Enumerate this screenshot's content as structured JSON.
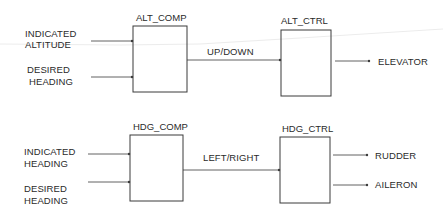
{
  "diagram": {
    "blocks": [
      {
        "id": "alt_comp",
        "title": "ALT_COMP"
      },
      {
        "id": "alt_ctrl",
        "title": "ALT_CTRL"
      },
      {
        "id": "hdg_comp",
        "title": "HDG_COMP"
      },
      {
        "id": "hdg_ctrl",
        "title": "HDG_CTRL"
      }
    ],
    "altitude_section": {
      "inputs": [
        {
          "line1": "INDICATED",
          "line2": "ALTITUDE"
        },
        {
          "line1": "DESIRED",
          "line2": "HEADING"
        }
      ],
      "link_label": "UP/DOWN",
      "outputs": [
        "ELEVATOR"
      ]
    },
    "heading_section": {
      "inputs": [
        {
          "line1": "INDICATED",
          "line2": "HEADING"
        },
        {
          "line1": "DESIRED",
          "line2": "HEADING"
        }
      ],
      "link_label": "LEFT/RIGHT",
      "outputs": [
        "RUDDER",
        "AILERON"
      ]
    },
    "colors": {
      "line": "#3a3a3a",
      "scan_artifact": "#e6e6e6"
    }
  }
}
